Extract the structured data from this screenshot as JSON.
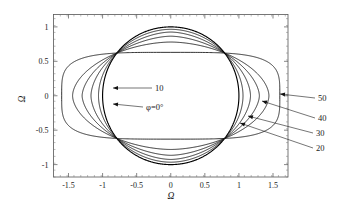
{
  "chart_data": {
    "type": "line",
    "title": "",
    "xlabel": "Ω",
    "ylabel": "Ω",
    "xlim": [
      -1.72,
      1.72
    ],
    "ylim": [
      -1.18,
      1.18
    ],
    "grid": false,
    "legend_position": "inline-annotations",
    "xticks": [
      "-1.5",
      "-1",
      "-0.5",
      "0",
      "0.5",
      "1",
      "1.5"
    ],
    "xtick_values": [
      -1.5,
      -1,
      -0.5,
      0,
      0.5,
      1,
      1.5
    ],
    "yticks": [
      "1",
      "0.5",
      "0",
      "-0.5",
      "-1"
    ],
    "ytick_values": [
      1,
      0.5,
      0,
      -0.5,
      -1
    ],
    "crossing_points": [
      [
        -0.79,
        0.62
      ],
      [
        0.79,
        0.62
      ],
      [
        -0.79,
        -0.62
      ],
      [
        0.79,
        -0.62
      ]
    ],
    "series": [
      {
        "name": "φ=0°",
        "label": "φ=0°",
        "x_extent": 1.0,
        "y_extent": 1.0,
        "width_half": 1.0,
        "height_half": 1.0
      },
      {
        "name": "10",
        "label": "10",
        "x_extent": 1.06,
        "y_extent": 0.965,
        "width_half": 1.06,
        "height_half": 0.965
      },
      {
        "name": "20",
        "label": "20",
        "x_extent": 1.17,
        "y_extent": 0.925,
        "width_half": 1.17,
        "height_half": 0.925
      },
      {
        "name": "30",
        "label": "30",
        "x_extent": 1.3,
        "y_extent": 0.865,
        "width_half": 1.3,
        "height_half": 0.865
      },
      {
        "name": "40",
        "label": "40",
        "x_extent": 1.44,
        "y_extent": 0.78,
        "width_half": 1.44,
        "height_half": 0.78
      },
      {
        "name": "50",
        "label": "50",
        "x_extent": 1.6,
        "y_extent": 0.63,
        "width_half": 1.6,
        "height_half": 0.63
      }
    ],
    "annotations": [
      {
        "text": "10",
        "x": 1540,
        "y": 880,
        "target": "curve-10",
        "side": "left"
      },
      {
        "text": "φ=0°",
        "x": 1460,
        "y": 1072,
        "target": "curve-phi0",
        "side": "left"
      },
      {
        "text": "50",
        "x": 3180,
        "y": 975,
        "target": "curve-50",
        "side": "right"
      },
      {
        "text": "40",
        "x": 3180,
        "y": 1178,
        "target": "curve-40",
        "side": "right"
      },
      {
        "text": "30",
        "x": 3165,
        "y": 1330,
        "target": "curve-30",
        "side": "right"
      },
      {
        "text": "20",
        "x": 3165,
        "y": 1480,
        "target": "curve-20",
        "side": "right"
      }
    ]
  },
  "axis": {
    "x_title": "Ω",
    "y_title": "Ω",
    "x_labels": [
      "-1.5",
      "-1",
      "-0.5",
      "0",
      "0.5",
      "1",
      "1.5"
    ],
    "y_labels": [
      "1",
      "0.5",
      "0",
      "-0.5",
      "-1"
    ]
  },
  "annotations": {
    "label_10": "10",
    "label_phi": "φ=0°",
    "label_20": "20",
    "label_30": "30",
    "label_40": "40",
    "label_50": "50"
  },
  "colors": {
    "curve": "#111111",
    "frame": "#555555",
    "background": "#ffffff",
    "text": "#1a1a1a"
  }
}
